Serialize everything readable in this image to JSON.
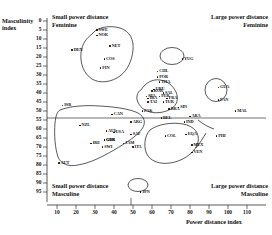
{
  "figure": {
    "quadrants": {
      "top_left_line1": "Small power distance",
      "top_left_line2": "Feminine",
      "top_right_line1": "Large power distance",
      "top_right_line2": "Feminine",
      "bottom_left_line1": "Small power distance",
      "bottom_left_line2": "Masculine",
      "bottom_right_line1": "Large power distance",
      "bottom_right_line2": "Masculine"
    }
  },
  "chart_data": {
    "type": "scatter",
    "title": "",
    "xlabel": "Power distance index",
    "ylabel_line1": "Masculinity",
    "ylabel_line2": "index",
    "xlim": [
      5,
      118
    ],
    "ylim": [
      0,
      97
    ],
    "y_inverted": true,
    "grid": false,
    "legend": "none",
    "xticks": [
      10,
      20,
      30,
      40,
      50,
      60,
      70,
      80,
      90,
      100,
      110
    ],
    "yticks": [
      0,
      5,
      10,
      15,
      20,
      25,
      30,
      35,
      40,
      45,
      50,
      55,
      60,
      65,
      70,
      75,
      80,
      85,
      90,
      95
    ],
    "divider_x": 47,
    "divider_y": 50,
    "points": [
      {
        "code": "SWE",
        "x": 31,
        "y": 5
      },
      {
        "code": "NOR",
        "x": 31,
        "y": 8
      },
      {
        "code": "NET",
        "x": 38,
        "y": 14
      },
      {
        "code": "DEN",
        "x": 18,
        "y": 16
      },
      {
        "code": "COS",
        "x": 35,
        "y": 21
      },
      {
        "code": "FIN",
        "x": 33,
        "y": 26
      },
      {
        "code": "YUG",
        "x": 76,
        "y": 21
      },
      {
        "code": "CHL",
        "x": 63,
        "y": 28
      },
      {
        "code": "POR",
        "x": 63,
        "y": 31
      },
      {
        "code": "THA",
        "x": 64,
        "y": 34
      },
      {
        "code": "GUA",
        "x": 95,
        "y": 37
      },
      {
        "code": "PAN",
        "x": 95,
        "y": 44
      },
      {
        "code": "URU",
        "x": 61,
        "y": 38
      },
      {
        "code": "TAI",
        "x": 58,
        "y": 45
      },
      {
        "code": "SAL",
        "x": 66,
        "y": 40
      },
      {
        "code": "KOR",
        "x": 60,
        "y": 39
      },
      {
        "code": "IRA",
        "x": 58,
        "y": 43
      },
      {
        "code": "FRA",
        "x": 68,
        "y": 43
      },
      {
        "code": "SPA",
        "x": 57,
        "y": 42
      },
      {
        "code": "PER",
        "x": 64,
        "y": 42
      },
      {
        "code": "TUR",
        "x": 66,
        "y": 45
      },
      {
        "code": "BRA",
        "x": 69,
        "y": 49
      },
      {
        "code": "SIN",
        "x": 74,
        "y": 48
      },
      {
        "code": "ISR",
        "x": 13,
        "y": 47
      },
      {
        "code": "CAN",
        "x": 39,
        "y": 52
      },
      {
        "code": "NZL",
        "x": 22,
        "y": 58
      },
      {
        "code": "AUL",
        "x": 36,
        "y": 61
      },
      {
        "code": "USA",
        "x": 40,
        "y": 62
      },
      {
        "code": "GBR",
        "x": 35,
        "y": 66
      },
      {
        "code": "GER",
        "x": 35,
        "y": 66
      },
      {
        "code": "SAF",
        "x": 49,
        "y": 63
      },
      {
        "code": "IRE",
        "x": 28,
        "y": 68
      },
      {
        "code": "SWI",
        "x": 34,
        "y": 70
      },
      {
        "code": "ITA",
        "x": 50,
        "y": 70
      },
      {
        "code": "AUT",
        "x": 11,
        "y": 79
      },
      {
        "code": "JAM",
        "x": 45,
        "y": 68
      },
      {
        "code": "PAK",
        "x": 55,
        "y": 50
      },
      {
        "code": "BEL",
        "x": 65,
        "y": 54
      },
      {
        "code": "ARA",
        "x": 80,
        "y": 53
      },
      {
        "code": "ARG",
        "x": 49,
        "y": 56
      },
      {
        "code": "IND",
        "x": 77,
        "y": 56
      },
      {
        "code": "COL",
        "x": 67,
        "y": 64
      },
      {
        "code": "EQA",
        "x": 78,
        "y": 63
      },
      {
        "code": "MEX",
        "x": 81,
        "y": 69
      },
      {
        "code": "VEN",
        "x": 81,
        "y": 73
      },
      {
        "code": "MAL",
        "x": 104,
        "y": 50
      },
      {
        "code": "PHI",
        "x": 94,
        "y": 64
      },
      {
        "code": "JPN",
        "x": 54,
        "y": 95
      }
    ],
    "clusters": [
      {
        "name": "nordic-feminine-cluster",
        "members": [
          "SWE",
          "NOR",
          "NET",
          "DEN",
          "COS",
          "FIN"
        ]
      },
      {
        "name": "yugoslavia-oval",
        "members": [
          "YUG"
        ]
      },
      {
        "name": "latin-asian-cluster",
        "members": [
          "CHL",
          "POR",
          "THA",
          "URU",
          "TAI",
          "SAL",
          "KOR",
          "IRA",
          "FRA",
          "SPA",
          "PER",
          "TUR",
          "BRA",
          "SIN"
        ]
      },
      {
        "name": "guatemala-panama-oval",
        "members": [
          "GUA",
          "PAN"
        ]
      },
      {
        "name": "anglo-cluster",
        "members": [
          "ISR",
          "CAN",
          "NZL",
          "AUL",
          "USA",
          "GBR",
          "GER",
          "SAF",
          "IRE",
          "SWI",
          "ITA",
          "JAM"
        ]
      },
      {
        "name": "latin-america-cluster",
        "members": [
          "COL",
          "EQA",
          "MEX",
          "VEN"
        ]
      },
      {
        "name": "japan-oval",
        "members": [
          "JPN"
        ]
      }
    ]
  }
}
